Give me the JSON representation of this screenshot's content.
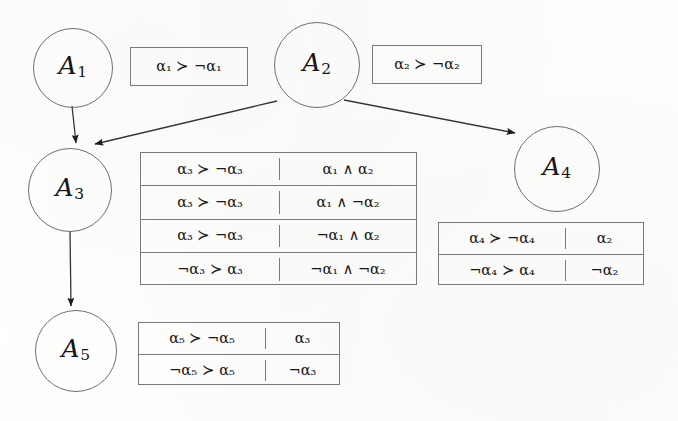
{
  "figure": {
    "type": "argumentation-graph-with-preference-tables",
    "background_color": "#fdfdfd",
    "stroke_color": "#6f6f6f",
    "text_color": "#171717"
  },
  "nodes": [
    {
      "id": "A1",
      "label": "A",
      "index": "1",
      "x": 33,
      "y": 28,
      "size": 78
    },
    {
      "id": "A2",
      "label": "A",
      "index": "2",
      "x": 274,
      "y": 22,
      "size": 84
    },
    {
      "id": "A3",
      "label": "A",
      "index": "3",
      "x": 28,
      "y": 148,
      "size": 82
    },
    {
      "id": "A4",
      "label": "A",
      "index": "4",
      "x": 514,
      "y": 126,
      "size": 84
    },
    {
      "id": "A5",
      "label": "A",
      "index": "5",
      "x": 35,
      "y": 310,
      "size": 80
    }
  ],
  "edges": [
    {
      "from": "A1",
      "to": "A3",
      "x1": 72,
      "y1": 106,
      "x2": 76,
      "y2": 146
    },
    {
      "from": "A2",
      "to": "A3",
      "x1": 277,
      "y1": 101,
      "x2": 92,
      "y2": 144
    },
    {
      "from": "A2",
      "to": "A4",
      "x1": 344,
      "y1": 100,
      "x2": 517,
      "y2": 134
    },
    {
      "from": "A3",
      "to": "A5",
      "x1": 70,
      "y1": 231,
      "x2": 71,
      "y2": 308
    }
  ],
  "boxes": {
    "a1_box": {
      "owner": "A1",
      "x": 130,
      "y": 47,
      "width": 118,
      "height": 39,
      "rows": [
        {
          "left": "α₁ ≻ ¬α₁",
          "right": null
        }
      ]
    },
    "a2_box": {
      "owner": "A2",
      "x": 372,
      "y": 45,
      "width": 110,
      "height": 39,
      "rows": [
        {
          "left": "α₂ ≻ ¬α₂",
          "right": null
        }
      ]
    },
    "a3_table": {
      "owner": "A3",
      "x": 140,
      "y": 152,
      "width": 277,
      "height": 133,
      "left_col_width": 138,
      "rows": [
        {
          "left": "α₃ ≻ ¬α₃",
          "right": "α₁ ∧ α₂"
        },
        {
          "left": "α₃ ≻ ¬α₃",
          "right": "α₁ ∧ ¬α₂"
        },
        {
          "left": "α₃ ≻ ¬α₃",
          "right": "¬α₁ ∧ α₂"
        },
        {
          "left": "¬α₃ ≻ α₃",
          "right": "¬α₁ ∧ ¬α₂"
        }
      ]
    },
    "a4_table": {
      "owner": "A4",
      "x": 438,
      "y": 222,
      "width": 206,
      "height": 63,
      "left_col_width": 126,
      "rows": [
        {
          "left": "α₄ ≻ ¬α₄",
          "right": "α₂"
        },
        {
          "left": "¬α₄ ≻ α₄",
          "right": "¬α₂"
        }
      ]
    },
    "a5_table": {
      "owner": "A5",
      "x": 138,
      "y": 322,
      "width": 202,
      "height": 63,
      "left_col_width": 126,
      "rows": [
        {
          "left": "α₅ ≻ ¬α₅",
          "right": "α₃"
        },
        {
          "left": "¬α₅ ≻ α₅",
          "right": "¬α₃"
        }
      ]
    }
  },
  "symbols": {
    "prefer": "≻",
    "negation": "¬",
    "conjunction": "∧",
    "alpha": "α"
  }
}
